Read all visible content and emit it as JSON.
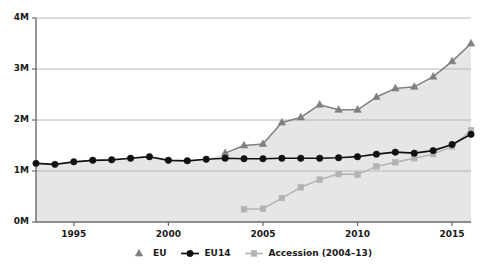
{
  "chart_data": {
    "type": "line",
    "title": "",
    "subtitle": "",
    "xlabel": "",
    "ylabel": "",
    "xlim": [
      1993,
      2016
    ],
    "ylim": [
      0,
      4000000
    ],
    "grid": true,
    "legend_position": "bottom",
    "y_ticks": [
      {
        "value": 0,
        "label": "0M"
      },
      {
        "value": 1000000,
        "label": "1M"
      },
      {
        "value": 2000000,
        "label": "2M"
      },
      {
        "value": 3000000,
        "label": "3M"
      },
      {
        "value": 4000000,
        "label": "4M"
      }
    ],
    "x_ticks": [
      {
        "value": 1995,
        "label": "1995"
      },
      {
        "value": 2000,
        "label": "2000"
      },
      {
        "value": 2005,
        "label": "2005"
      },
      {
        "value": 2010,
        "label": "2010"
      },
      {
        "value": 2015,
        "label": "2015"
      }
    ],
    "series": [
      {
        "name": "EU",
        "marker": "triangle",
        "color": "#808080",
        "x": [
          2003,
          2004,
          2005,
          2006,
          2007,
          2008,
          2009,
          2010,
          2011,
          2012,
          2013,
          2014,
          2015,
          2016
        ],
        "values": [
          1350000,
          1500000,
          1530000,
          1950000,
          2050000,
          2300000,
          2200000,
          2200000,
          2450000,
          2620000,
          2650000,
          2850000,
          3150000,
          3500000
        ]
      },
      {
        "name": "EU14",
        "marker": "circle",
        "color": "#111111",
        "x": [
          1993,
          1994,
          1995,
          1996,
          1997,
          1998,
          1999,
          2000,
          2001,
          2002,
          2003,
          2004,
          2005,
          2006,
          2007,
          2008,
          2009,
          2010,
          2011,
          2012,
          2013,
          2014,
          2015,
          2016
        ],
        "values": [
          1150000,
          1130000,
          1180000,
          1210000,
          1220000,
          1250000,
          1280000,
          1210000,
          1200000,
          1230000,
          1250000,
          1240000,
          1240000,
          1250000,
          1250000,
          1250000,
          1260000,
          1280000,
          1330000,
          1370000,
          1350000,
          1400000,
          1520000,
          1720000
        ]
      },
      {
        "name": "Accession (2004–13)",
        "marker": "square",
        "color": "#b3b3b3",
        "x": [
          2004,
          2005,
          2006,
          2007,
          2008,
          2009,
          2010,
          2011,
          2012,
          2013,
          2014,
          2015,
          2016
        ],
        "values": [
          250000,
          260000,
          470000,
          680000,
          830000,
          940000,
          930000,
          1090000,
          1170000,
          1250000,
          1330000,
          1480000,
          1800000
        ]
      }
    ]
  },
  "legend": {
    "items": [
      {
        "label": "EU",
        "marker": "triangle",
        "color": "#808080"
      },
      {
        "label": "EU14",
        "marker": "circle",
        "color": "#111111"
      },
      {
        "label": "Accession (2004–13)",
        "marker": "square",
        "color": "#b3b3b3"
      }
    ]
  },
  "colors": {
    "area_fill": "#e6e6e6",
    "grid": "#b0b0b0",
    "axis": "#6b6b6b",
    "text": "#1a1a1a"
  }
}
